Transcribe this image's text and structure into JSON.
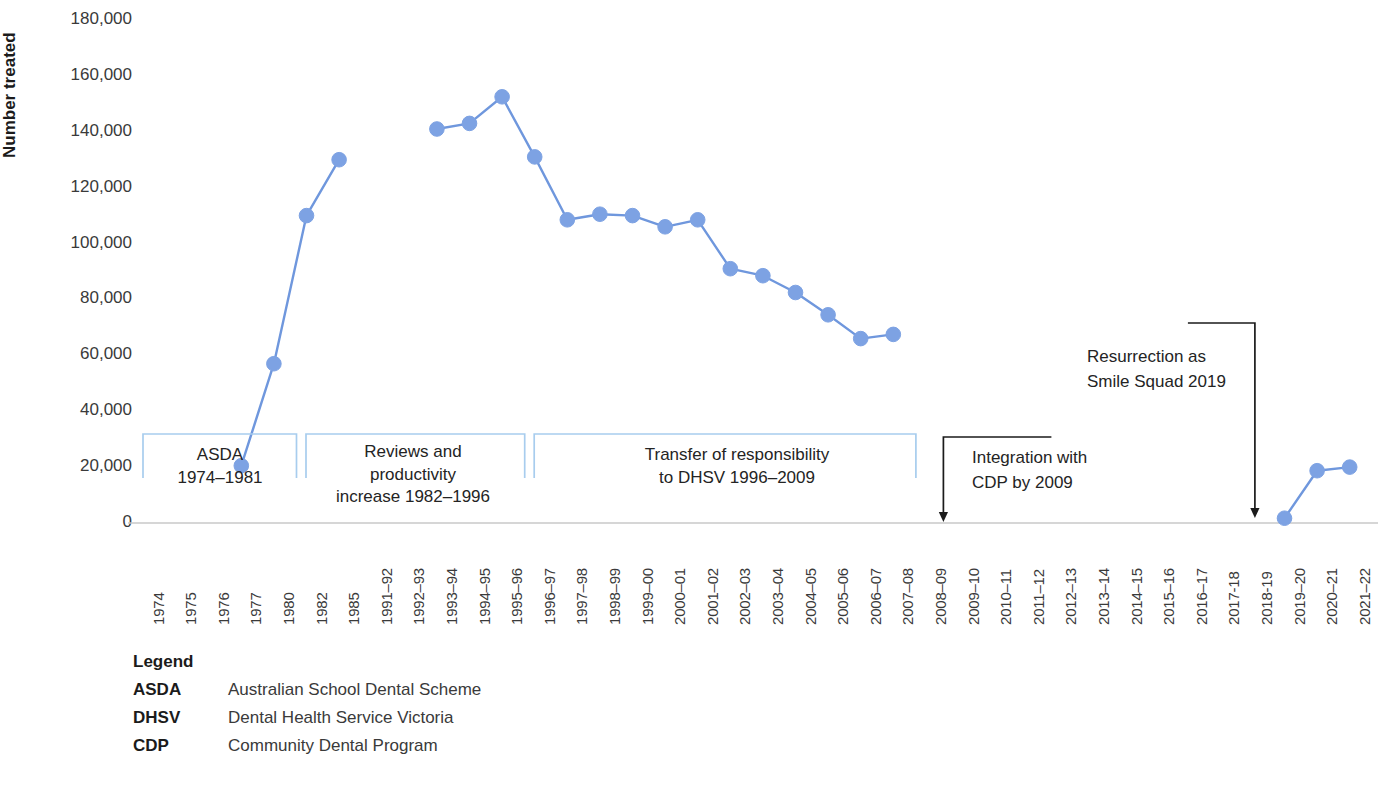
{
  "chart_data": {
    "type": "line",
    "title": "",
    "xlabel": "",
    "ylabel": "Number treated",
    "ylim": [
      0,
      180000
    ],
    "yticks": [
      180000,
      160000,
      140000,
      120000,
      100000,
      80000,
      60000,
      40000,
      20000,
      0
    ],
    "ytick_labels": [
      "180,000",
      "160,000",
      "140,000",
      "120,000",
      "100,000",
      "80,000",
      "60,000",
      "40,000",
      "20,000",
      "0"
    ],
    "grid": false,
    "legend_position": "below-left",
    "series_color": "#7da2e3",
    "line_color": "#6f97dd",
    "categories": [
      "1974",
      "1975",
      "1976",
      "1977",
      "1980",
      "1982",
      "1985",
      "1991–92",
      "1992–93",
      "1993–94",
      "1994–95",
      "1995–96",
      "1996–97",
      "1997–98",
      "1998–99",
      "1999–00",
      "2000–01",
      "2001–02",
      "2002–03",
      "2003–04",
      "2004–05",
      "2005–06",
      "2006–07",
      "2007–08",
      "2008–09",
      "2009–10",
      "2010–11",
      "2011–12",
      "2012–13",
      "2013–14",
      "2014–15",
      "2015–16",
      "2016–17",
      "2017-18",
      "2018-19",
      "2019–20",
      "2020–21",
      "2021–22"
    ],
    "series": [
      {
        "name": "Number treated",
        "values": [
          null,
          null,
          null,
          20500,
          57000,
          110000,
          130000,
          null,
          null,
          141000,
          143000,
          152500,
          131000,
          108500,
          110500,
          110000,
          106000,
          108500,
          91000,
          88500,
          82500,
          74500,
          66000,
          67500,
          null,
          null,
          null,
          null,
          null,
          null,
          null,
          null,
          null,
          null,
          null,
          1700,
          18700,
          20000
        ]
      }
    ],
    "bands": [
      {
        "name": "asda",
        "label": "ASDA\n1974–1981",
        "start_category": "1974",
        "end_category": "1982"
      },
      {
        "name": "reviews",
        "label": "Reviews and\nproductivity\nincrease 1982–1996",
        "start_category": "1982",
        "end_category": "1996–97"
      },
      {
        "name": "transfer",
        "label": "Transfer of responsibility\nto DHSV 1996–2009",
        "start_category": "1996–97",
        "end_category": "2008–09"
      }
    ],
    "annotations": [
      {
        "name": "integration-cdp",
        "label": "Integration with\nCDP by 2009",
        "target_category": "2008–09"
      },
      {
        "name": "resurrection-smile-squad",
        "label": "Resurrection as\nSmile Squad 2019",
        "target_category": "2018-19"
      }
    ]
  },
  "legend": {
    "title": "Legend",
    "entries": [
      {
        "abbr": "ASDA",
        "description": "Australian School Dental Scheme"
      },
      {
        "abbr": "DHSV",
        "description": "Dental Health Service Victoria"
      },
      {
        "abbr": "CDP",
        "description": "Community Dental Program"
      }
    ]
  }
}
